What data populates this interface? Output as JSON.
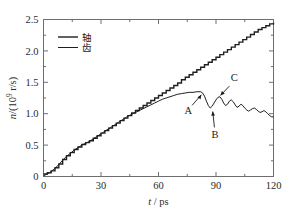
{
  "chart_data": {
    "type": "line",
    "title": "",
    "xlabel": "t / ps",
    "xlabel_symbol": "t",
    "xlabel_unit": "ps",
    "ylabel": "n/(10⁹ r/s)",
    "ylabel_symbol": "n",
    "ylabel_unit": "10⁹ r/s",
    "xlim": [
      0,
      120
    ],
    "ylim": [
      0,
      2.5
    ],
    "xticks": [
      0,
      30,
      60,
      90,
      120
    ],
    "xtick_labels": [
      "0",
      "30",
      "60",
      "90",
      "120"
    ],
    "xminor_ticks": [
      15,
      45,
      75,
      105
    ],
    "yticks": [
      0,
      0.5,
      1.0,
      1.5,
      2.0,
      2.5
    ],
    "ytick_labels": [
      "0",
      "0.5",
      "1.0",
      "1.5",
      "2.0",
      "2.5"
    ],
    "yminor_ticks": [
      0.25,
      0.75,
      1.25,
      1.75,
      2.25
    ],
    "grid": false,
    "legend_position": "upper-left",
    "series": [
      {
        "name": "轴",
        "color": "#1f1f1f",
        "style": "staircase",
        "linewidth": 1.4,
        "x": [
          0,
          2,
          4,
          6,
          8,
          10,
          12,
          14,
          16,
          18,
          20,
          22,
          24,
          26,
          28,
          30,
          32,
          34,
          36,
          38,
          40,
          42,
          44,
          46,
          48,
          50,
          52,
          54,
          56,
          58,
          60,
          62,
          64,
          66,
          68,
          70,
          72,
          74,
          76,
          78,
          80,
          82,
          84,
          86,
          88,
          90,
          92,
          94,
          96,
          98,
          100,
          102,
          104,
          106,
          108,
          110,
          112,
          114,
          116,
          118,
          120
        ],
        "values": [
          0.04,
          0.06,
          0.09,
          0.14,
          0.2,
          0.27,
          0.33,
          0.38,
          0.43,
          0.47,
          0.51,
          0.54,
          0.57,
          0.61,
          0.65,
          0.69,
          0.73,
          0.77,
          0.81,
          0.85,
          0.89,
          0.93,
          0.97,
          1.01,
          1.05,
          1.09,
          1.13,
          1.17,
          1.21,
          1.25,
          1.29,
          1.33,
          1.37,
          1.41,
          1.45,
          1.49,
          1.54,
          1.58,
          1.62,
          1.66,
          1.7,
          1.74,
          1.78,
          1.82,
          1.86,
          1.9,
          1.94,
          1.98,
          2.02,
          2.06,
          2.1,
          2.14,
          2.18,
          2.22,
          2.26,
          2.3,
          2.34,
          2.37,
          2.4,
          2.43,
          2.45
        ]
      },
      {
        "name": "齿",
        "color": "#1f1f1f",
        "style": "line",
        "linewidth": 1.0,
        "x": [
          0,
          2,
          4,
          6,
          8,
          10,
          12,
          14,
          16,
          18,
          20,
          22,
          24,
          26,
          28,
          30,
          32,
          34,
          36,
          38,
          40,
          42,
          44,
          46,
          48,
          50,
          52,
          54,
          56,
          58,
          60,
          62,
          64,
          66,
          68,
          70,
          72,
          74,
          76,
          78,
          80,
          82,
          83,
          84,
          85,
          86,
          87,
          88,
          89,
          90,
          91,
          92,
          93,
          94,
          95,
          96,
          97,
          98,
          99,
          100,
          101,
          102,
          103,
          104,
          105,
          106,
          107,
          108,
          109,
          110,
          111,
          112,
          113,
          114,
          115,
          116,
          117,
          118,
          119,
          120
        ],
        "values": [
          0.01,
          0.04,
          0.08,
          0.13,
          0.19,
          0.26,
          0.32,
          0.37,
          0.42,
          0.46,
          0.5,
          0.53,
          0.56,
          0.6,
          0.64,
          0.68,
          0.72,
          0.76,
          0.8,
          0.84,
          0.88,
          0.92,
          0.96,
          0.99,
          1.02,
          1.05,
          1.08,
          1.11,
          1.14,
          1.17,
          1.2,
          1.23,
          1.25,
          1.27,
          1.29,
          1.31,
          1.32,
          1.33,
          1.34,
          1.34,
          1.35,
          1.35,
          1.33,
          1.28,
          1.2,
          1.13,
          1.09,
          1.12,
          1.17,
          1.22,
          1.26,
          1.27,
          1.23,
          1.17,
          1.13,
          1.15,
          1.2,
          1.22,
          1.19,
          1.14,
          1.1,
          1.12,
          1.15,
          1.13,
          1.09,
          1.06,
          1.04,
          1.06,
          1.08,
          1.09,
          1.07,
          1.04,
          1.02,
          1.03,
          1.05,
          1.03,
          1.0,
          0.97,
          0.95,
          0.95
        ]
      }
    ],
    "annotations": [
      {
        "label": "A",
        "label_x": 75.5,
        "label_y": 0.99,
        "target_x": 83.0,
        "target_y": 1.33
      },
      {
        "label": "B",
        "label_x": 89.5,
        "label_y": 0.62,
        "target_x": 88.2,
        "target_y": 1.07
      },
      {
        "label": "C",
        "label_x": 99.5,
        "label_y": 1.52,
        "target_x": 91.5,
        "target_y": 1.265
      }
    ]
  },
  "legend": {
    "entries": [
      {
        "label": "轴"
      },
      {
        "label": "齿"
      }
    ]
  }
}
